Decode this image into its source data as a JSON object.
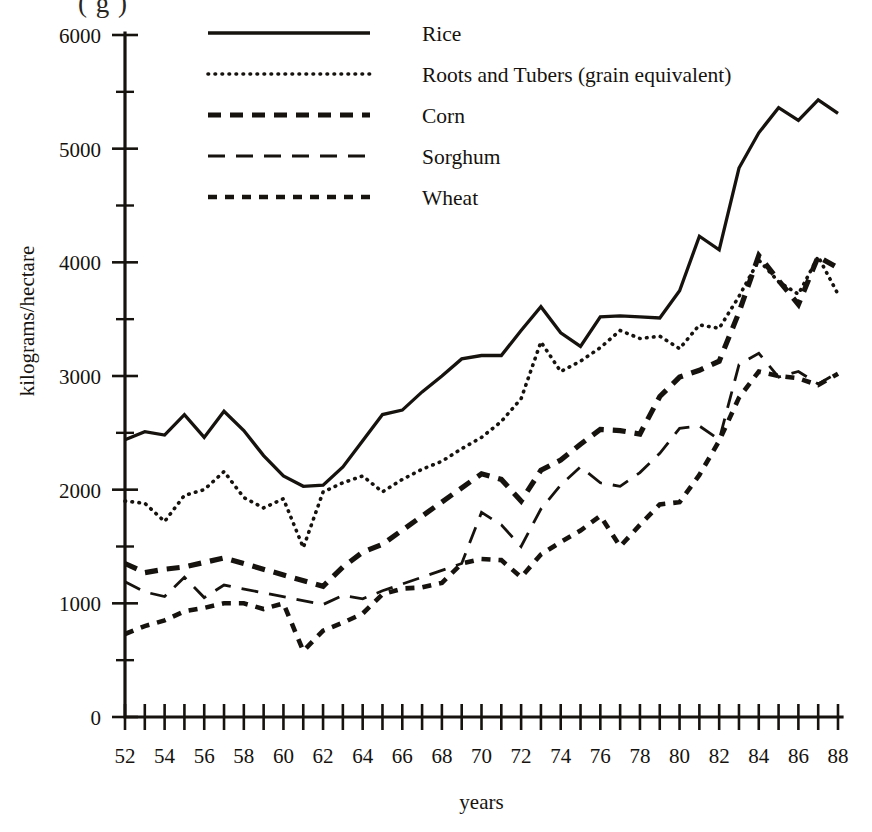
{
  "figure": {
    "top_caption_fragment": "( g   )",
    "bottom_bleed_fragment": "          "
  },
  "axes": {
    "y_title": "kilograms/hectare",
    "x_title": "years",
    "y_ticks_major": [
      "0",
      "1000",
      "2000",
      "3000",
      "4000",
      "5000",
      "6000"
    ],
    "x_ticks_labeled": [
      "52",
      "54",
      "56",
      "58",
      "60",
      "62",
      "64",
      "66",
      "68",
      "70",
      "72",
      "74",
      "76",
      "78",
      "80",
      "82",
      "84",
      "86",
      "88"
    ]
  },
  "legend": {
    "items": [
      {
        "label": "Rice",
        "style": "solid"
      },
      {
        "label": "Roots and Tubers (grain equivalent)",
        "style": "dotted"
      },
      {
        "label": "Corn",
        "style": "dashed-thick"
      },
      {
        "label": "Sorghum",
        "style": "dashed-long"
      },
      {
        "label": "Wheat",
        "style": "dashed-medium"
      }
    ]
  },
  "chart_data": {
    "type": "line",
    "title": "",
    "xlabel": "years",
    "ylabel": "kilograms/hectare",
    "xlim": [
      52,
      88
    ],
    "ylim": [
      0,
      6000
    ],
    "grid": false,
    "legend_position": "top-center",
    "x": [
      52,
      53,
      54,
      55,
      56,
      57,
      58,
      59,
      60,
      61,
      62,
      63,
      64,
      65,
      66,
      67,
      68,
      69,
      70,
      71,
      72,
      73,
      74,
      75,
      76,
      77,
      78,
      79,
      80,
      81,
      82,
      83,
      84,
      85,
      86,
      87,
      88
    ],
    "series": [
      {
        "name": "Rice",
        "style": "solid",
        "x": [
          52,
          53,
          54,
          55,
          56,
          57,
          58,
          59,
          60,
          61,
          62,
          63,
          64,
          65,
          66,
          67,
          68,
          69,
          70,
          71,
          72,
          73,
          74,
          75,
          76,
          77,
          78,
          79,
          80,
          81,
          82,
          83,
          84,
          85,
          86,
          87,
          88
        ],
        "values": [
          2440,
          2510,
          2480,
          2660,
          2460,
          2690,
          2520,
          2300,
          2120,
          2030,
          2040,
          2200,
          2430,
          2660,
          2700,
          2860,
          3000,
          3150,
          3180,
          3180,
          3400,
          3610,
          3380,
          3260,
          3520,
          3530,
          3520,
          3510,
          3750,
          4230,
          4110,
          4830,
          5140,
          5360,
          5250,
          5430,
          5310
        ]
      },
      {
        "name": "Roots and Tubers (grain equivalent)",
        "style": "dotted",
        "x": [
          52,
          53,
          54,
          55,
          56,
          57,
          58,
          59,
          60,
          61,
          62,
          63,
          64,
          65,
          66,
          67,
          68,
          69,
          70,
          71,
          72,
          73,
          74,
          75,
          76,
          77,
          78,
          79,
          80,
          81,
          82,
          83,
          84,
          85,
          86,
          87,
          88
        ],
        "values": [
          1900,
          1880,
          1720,
          1950,
          2000,
          2160,
          1930,
          1840,
          1920,
          1490,
          1980,
          2060,
          2120,
          1980,
          2090,
          2180,
          2250,
          2360,
          2460,
          2600,
          2800,
          3300,
          3040,
          3130,
          3250,
          3400,
          3330,
          3350,
          3240,
          3450,
          3420,
          3700,
          4020,
          3830,
          3720,
          4050,
          3720
        ]
      },
      {
        "name": "Corn",
        "style": "dashed-thick",
        "x": [
          52,
          53,
          54,
          55,
          56,
          57,
          62,
          63,
          64,
          65,
          70,
          71,
          72,
          73,
          74,
          75,
          76,
          77,
          78,
          79,
          80,
          81,
          82,
          83,
          84,
          85,
          86,
          87,
          88
        ],
        "values": [
          1350,
          1270,
          1300,
          1320,
          1360,
          1400,
          1150,
          1320,
          1450,
          1520,
          2140,
          2090,
          1900,
          2170,
          2260,
          2400,
          2530,
          2520,
          2490,
          2820,
          2990,
          3050,
          3130,
          3560,
          4060,
          3840,
          3630,
          4050,
          3950
        ]
      },
      {
        "name": "Sorghum",
        "style": "dashed-long",
        "x": [
          52,
          53,
          54,
          55,
          56,
          57,
          62,
          63,
          64,
          65,
          69,
          70,
          71,
          72,
          73,
          74,
          75,
          76,
          77,
          78,
          79,
          80,
          81,
          82,
          83,
          84,
          85,
          86,
          87,
          88
        ],
        "values": [
          1190,
          1100,
          1060,
          1230,
          1050,
          1160,
          990,
          1070,
          1040,
          1110,
          1350,
          1800,
          1690,
          1500,
          1830,
          2040,
          2200,
          2060,
          2030,
          2150,
          2320,
          2540,
          2560,
          2440,
          3100,
          3200,
          2990,
          3040,
          2930,
          3030
        ]
      },
      {
        "name": "Wheat",
        "style": "dashed-medium",
        "x": [
          52,
          53,
          54,
          55,
          56,
          57,
          58,
          59,
          60,
          61,
          62,
          63,
          64,
          65,
          66,
          67,
          68,
          69,
          70,
          71,
          72,
          73,
          74,
          75,
          76,
          77,
          78,
          79,
          80,
          81,
          82,
          83,
          84,
          85,
          86,
          87,
          88
        ],
        "values": [
          730,
          800,
          850,
          930,
          960,
          1000,
          1000,
          950,
          1000,
          580,
          760,
          830,
          910,
          1080,
          1130,
          1140,
          1180,
          1350,
          1390,
          1380,
          1230,
          1430,
          1540,
          1640,
          1770,
          1500,
          1690,
          1870,
          1890,
          2130,
          2430,
          2810,
          3040,
          3000,
          2980,
          2920,
          3020
        ]
      }
    ]
  }
}
